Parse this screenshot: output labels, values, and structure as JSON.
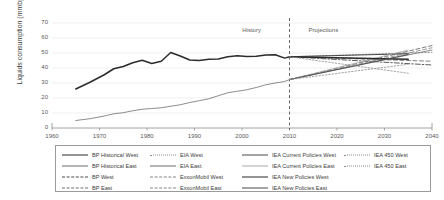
{
  "chart_data": {
    "type": "line",
    "title": "",
    "xlabel": "",
    "ylabel": "Liquids consumption (mmbpd)",
    "xlim": [
      1960,
      2040
    ],
    "ylim": [
      0,
      70
    ],
    "xticks": [
      1960,
      1970,
      1980,
      1990,
      2000,
      2010,
      2020,
      2030,
      2040
    ],
    "yticks": [
      0,
      10,
      20,
      30,
      40,
      50,
      60,
      70
    ],
    "grid": "horizontal",
    "legend_position": "bottom",
    "annotations": [
      {
        "text": "History",
        "x": 2003,
        "y": 65
      },
      {
        "text": "Projections",
        "x": 2014,
        "y": 65
      },
      {
        "text": "divider",
        "x": 2010,
        "style": "dashed-vertical"
      }
    ],
    "series": [
      {
        "name": "BP Historical West",
        "style": "solid-thick",
        "color": "#2b2b2b",
        "x": [
          1965,
          1968,
          1971,
          1973,
          1975,
          1977,
          1979,
          1981,
          1983,
          1985,
          1987,
          1989,
          1991,
          1993,
          1995,
          1997,
          1999,
          2001,
          2003,
          2005,
          2007,
          2009,
          2010
        ],
        "values": [
          26.0,
          30.5,
          35.5,
          39.5,
          41.0,
          43.5,
          45.2,
          43.0,
          44.5,
          50.3,
          48.0,
          45.3,
          45.0,
          45.8,
          46.0,
          47.5,
          48.2,
          47.6,
          47.8,
          48.6,
          48.8,
          46.6,
          47.5
        ]
      },
      {
        "name": "BP Historical East",
        "style": "solid-thin",
        "color": "#6e6e6e",
        "x": [
          1965,
          1968,
          1971,
          1973,
          1975,
          1977,
          1979,
          1981,
          1983,
          1985,
          1987,
          1989,
          1991,
          1993,
          1995,
          1997,
          1999,
          2001,
          2003,
          2005,
          2007,
          2009,
          2010
        ],
        "values": [
          5.0,
          6.2,
          8.0,
          9.5,
          10.2,
          11.5,
          12.5,
          13.0,
          13.5,
          14.5,
          15.5,
          17.0,
          18.2,
          19.5,
          21.5,
          23.5,
          24.5,
          25.5,
          27.0,
          28.8,
          30.0,
          31.0,
          32.3
        ]
      },
      {
        "name": "BP West",
        "style": "dashdot",
        "color": "#4a4a4a",
        "x": [
          2010,
          2040
        ],
        "values": [
          47.5,
          42.0
        ]
      },
      {
        "name": "BP East",
        "style": "dashed",
        "color": "#707070",
        "x": [
          2010,
          2040
        ],
        "values": [
          32.3,
          55.0
        ]
      },
      {
        "name": "EIA West",
        "style": "dotted",
        "color": "#8a8a8a",
        "x": [
          2010,
          2040
        ],
        "values": [
          47.5,
          50.5
        ]
      },
      {
        "name": "EIA East",
        "style": "solid-thin",
        "color": "#6e6e6e",
        "x": [
          2010,
          2040
        ],
        "values": [
          32.3,
          52.0
        ]
      },
      {
        "name": "ExxonMobil West",
        "style": "dashed",
        "color": "#707070",
        "x": [
          2010,
          2040
        ],
        "values": [
          47.5,
          44.5
        ]
      },
      {
        "name": "ExxonMobil East",
        "style": "dashed",
        "color": "#8f8f8f",
        "x": [
          2010,
          2040
        ],
        "values": [
          32.3,
          53.5
        ]
      },
      {
        "name": "IEA Current Policies West",
        "style": "solid-med",
        "color": "#4a4a4a",
        "x": [
          2010,
          2035
        ],
        "values": [
          47.5,
          49.5
        ]
      },
      {
        "name": "IEA Current Policies East",
        "style": "solid-grey",
        "color": "#a8a8a8",
        "x": [
          2010,
          2035
        ],
        "values": [
          32.3,
          52.0
        ]
      },
      {
        "name": "IEA New Policies West",
        "style": "solid-thick",
        "color": "#2b2b2b",
        "x": [
          2010,
          2035
        ],
        "values": [
          47.5,
          45.8
        ]
      },
      {
        "name": "IEA New Policies East",
        "style": "solid-med",
        "color": "#555555",
        "x": [
          2010,
          2035
        ],
        "values": [
          32.3,
          49.0
        ]
      },
      {
        "name": "IEA 450 West",
        "style": "dotted",
        "color": "#9a9a9a",
        "x": [
          2010,
          2035
        ],
        "values": [
          47.5,
          36.5
        ]
      },
      {
        "name": "IEA 450 East",
        "style": "dotted",
        "color": "#9a9a9a",
        "x": [
          2010,
          2035
        ],
        "values": [
          32.3,
          42.5
        ]
      }
    ]
  },
  "legend": {
    "columns": [
      {
        "items": [
          {
            "label": "BP Historical West",
            "style": "s-solid-thick"
          },
          {
            "label": "BP Historical East",
            "style": "s-solid-thin"
          },
          {
            "label": "BP West",
            "style": "s-dashdot"
          },
          {
            "label": "BP East",
            "style": "s-dashed"
          }
        ]
      },
      {
        "items": [
          {
            "label": "EIA West",
            "style": "s-dotted"
          },
          {
            "label": "EIA East",
            "style": "s-solid-thin"
          },
          {
            "label": "ExxonMobil West",
            "style": "s-dashlong"
          },
          {
            "label": "ExxonMobil East",
            "style": "s-dashlong"
          }
        ]
      },
      {
        "items": [
          {
            "label": "IEA Current Policies West",
            "style": "s-solid-med"
          },
          {
            "label": "IEA Current Policies East",
            "style": "s-solid-grey"
          },
          {
            "label": "IEA New Policies West",
            "style": "s-solid-thick"
          },
          {
            "label": "IEA New Policies East",
            "style": "s-solid-med"
          }
        ]
      },
      {
        "items": [
          {
            "label": "IEA 450 West",
            "style": "s-dotted"
          },
          {
            "label": "IEA 450 East",
            "style": "s-dotted"
          }
        ]
      }
    ]
  }
}
